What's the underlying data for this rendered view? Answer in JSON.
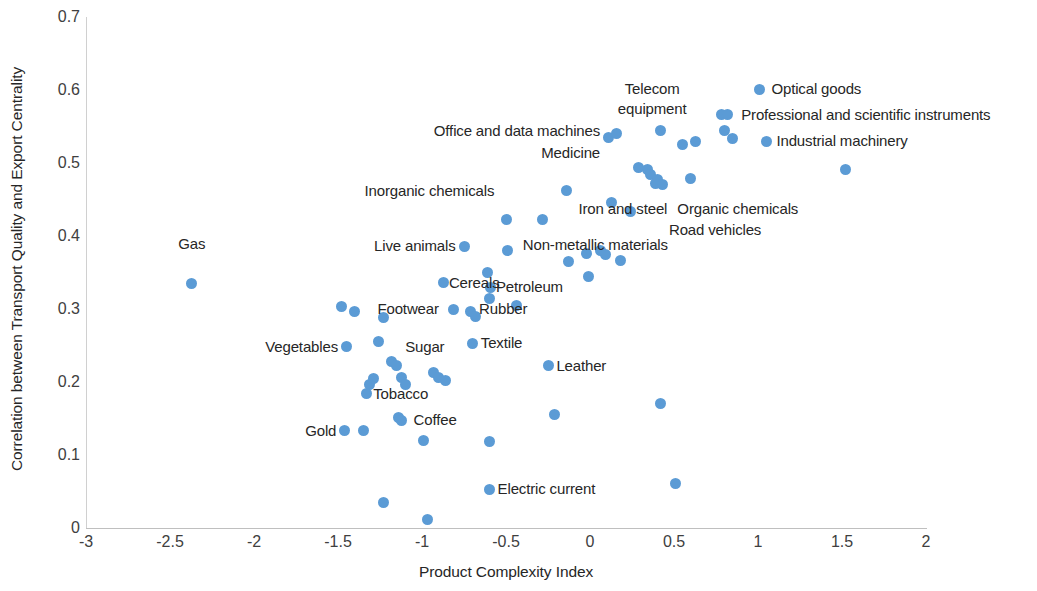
{
  "chart_data": {
    "type": "scatter",
    "title": "",
    "xlabel": "Product Complexity Index",
    "ylabel": "Correlation between Transport Quality and Export Centrality",
    "xlim": [
      -3,
      2
    ],
    "ylim": [
      0,
      0.7
    ],
    "xticks": [
      "-3",
      "-2.5",
      "-2",
      "-1.5",
      "-1",
      "-0.5",
      "0",
      "0.5",
      "1",
      "1.5",
      "2"
    ],
    "xtick_values": [
      -3,
      -2.5,
      -2,
      -1.5,
      -1,
      -0.5,
      0,
      0.5,
      1,
      1.5,
      2
    ],
    "yticks": [
      "0",
      "0.1",
      "0.2",
      "0.3",
      "0.4",
      "0.5",
      "0.6",
      "0.7"
    ],
    "ytick_values": [
      0,
      0.1,
      0.2,
      0.3,
      0.4,
      0.5,
      0.6,
      0.7
    ],
    "grid": false,
    "legend": false,
    "marker_color": "#5b9bd5",
    "axis_color": "#bfbfbf",
    "points": [
      {
        "x": -2.37,
        "y": 0.335
      },
      {
        "x": -1.48,
        "y": 0.304
      },
      {
        "x": -1.4,
        "y": 0.297
      },
      {
        "x": -1.45,
        "y": 0.248
      },
      {
        "x": -1.26,
        "y": 0.255
      },
      {
        "x": -1.29,
        "y": 0.205
      },
      {
        "x": -1.31,
        "y": 0.196
      },
      {
        "x": -1.33,
        "y": 0.184
      },
      {
        "x": -1.46,
        "y": 0.133
      },
      {
        "x": -1.35,
        "y": 0.133
      },
      {
        "x": -1.23,
        "y": 0.288
      },
      {
        "x": -1.18,
        "y": 0.228
      },
      {
        "x": -1.15,
        "y": 0.222
      },
      {
        "x": -1.12,
        "y": 0.206
      },
      {
        "x": -1.1,
        "y": 0.197
      },
      {
        "x": -1.14,
        "y": 0.152
      },
      {
        "x": -1.12,
        "y": 0.147
      },
      {
        "x": -1.23,
        "y": 0.035
      },
      {
        "x": -0.99,
        "y": 0.12
      },
      {
        "x": -0.97,
        "y": 0.011
      },
      {
        "x": -0.93,
        "y": 0.213
      },
      {
        "x": -0.9,
        "y": 0.206
      },
      {
        "x": -0.86,
        "y": 0.202
      },
      {
        "x": -0.87,
        "y": 0.336
      },
      {
        "x": -0.81,
        "y": 0.3
      },
      {
        "x": -0.75,
        "y": 0.386
      },
      {
        "x": -0.71,
        "y": 0.297
      },
      {
        "x": -0.68,
        "y": 0.29
      },
      {
        "x": -0.7,
        "y": 0.253
      },
      {
        "x": -0.61,
        "y": 0.35
      },
      {
        "x": -0.59,
        "y": 0.33
      },
      {
        "x": -0.6,
        "y": 0.315
      },
      {
        "x": -0.6,
        "y": 0.119
      },
      {
        "x": -0.6,
        "y": 0.053
      },
      {
        "x": -0.5,
        "y": 0.422
      },
      {
        "x": -0.49,
        "y": 0.38
      },
      {
        "x": -0.44,
        "y": 0.305
      },
      {
        "x": -0.28,
        "y": 0.422
      },
      {
        "x": -0.25,
        "y": 0.222
      },
      {
        "x": -0.21,
        "y": 0.155
      },
      {
        "x": -0.14,
        "y": 0.462
      },
      {
        "x": -0.13,
        "y": 0.365
      },
      {
        "x": -0.02,
        "y": 0.376
      },
      {
        "x": -0.01,
        "y": 0.344
      },
      {
        "x": 0.06,
        "y": 0.38
      },
      {
        "x": 0.09,
        "y": 0.374
      },
      {
        "x": 0.11,
        "y": 0.535
      },
      {
        "x": 0.16,
        "y": 0.541
      },
      {
        "x": 0.13,
        "y": 0.446
      },
      {
        "x": 0.18,
        "y": 0.366
      },
      {
        "x": 0.24,
        "y": 0.433
      },
      {
        "x": 0.29,
        "y": 0.494
      },
      {
        "x": 0.34,
        "y": 0.491
      },
      {
        "x": 0.36,
        "y": 0.484
      },
      {
        "x": 0.4,
        "y": 0.478
      },
      {
        "x": 0.39,
        "y": 0.472
      },
      {
        "x": 0.43,
        "y": 0.47
      },
      {
        "x": 0.42,
        "y": 0.544
      },
      {
        "x": 0.42,
        "y": 0.17
      },
      {
        "x": 0.51,
        "y": 0.061
      },
      {
        "x": 0.55,
        "y": 0.525
      },
      {
        "x": 0.6,
        "y": 0.479
      },
      {
        "x": 0.63,
        "y": 0.529
      },
      {
        "x": 0.78,
        "y": 0.566
      },
      {
        "x": 0.82,
        "y": 0.567
      },
      {
        "x": 0.8,
        "y": 0.545
      },
      {
        "x": 0.85,
        "y": 0.533
      },
      {
        "x": 1.01,
        "y": 0.601
      },
      {
        "x": 1.05,
        "y": 0.53
      },
      {
        "x": 1.52,
        "y": 0.491
      }
    ],
    "annotations": [
      {
        "text": "Gas",
        "x": -2.37,
        "y": 0.389,
        "align": "center"
      },
      {
        "text": "Vegetables",
        "x": -1.5,
        "y": 0.248,
        "align": "left"
      },
      {
        "text": "Gold",
        "x": -1.51,
        "y": 0.133,
        "align": "left"
      },
      {
        "text": "Tobacco",
        "x": -1.29,
        "y": 0.184,
        "align": "right"
      },
      {
        "text": "Sugar",
        "x": -1.1,
        "y": 0.248,
        "align": "right"
      },
      {
        "text": "Coffee",
        "x": -1.05,
        "y": 0.148,
        "align": "right"
      },
      {
        "text": "Footwear",
        "x": -0.9,
        "y": 0.3,
        "align": "left"
      },
      {
        "text": "Live animals",
        "x": -0.8,
        "y": 0.386,
        "align": "left"
      },
      {
        "text": "Cereals",
        "x": -0.84,
        "y": 0.336,
        "align": "right"
      },
      {
        "text": "Rubber",
        "x": -0.66,
        "y": 0.3,
        "align": "right"
      },
      {
        "text": "Textile",
        "x": -0.65,
        "y": 0.253,
        "align": "right"
      },
      {
        "text": "Petroleum",
        "x": -0.56,
        "y": 0.33,
        "align": "right"
      },
      {
        "text": "Inorganic chemicals",
        "x": -0.57,
        "y": 0.462,
        "align": "left"
      },
      {
        "text": "Leather",
        "x": -0.2,
        "y": 0.222,
        "align": "right"
      },
      {
        "text": "Electric current",
        "x": -0.55,
        "y": 0.053,
        "align": "right"
      },
      {
        "text": "Non-metallic materials",
        "x": -0.4,
        "y": 0.388,
        "align": "right"
      },
      {
        "text": "Office and data machines",
        "x": 0.06,
        "y": 0.544,
        "align": "left"
      },
      {
        "text": "Medicine",
        "x": 0.06,
        "y": 0.514,
        "align": "left"
      },
      {
        "text": "Telecom",
        "x": 0.37,
        "y": 0.601,
        "align": "center"
      },
      {
        "text": "equipment",
        "x": 0.37,
        "y": 0.574,
        "align": "center"
      },
      {
        "text": "Iron and steel",
        "x": 0.46,
        "y": 0.437,
        "align": "left"
      },
      {
        "text": "Road vehicles",
        "x": 0.47,
        "y": 0.408,
        "align": "right"
      },
      {
        "text": "Organic chemicals",
        "x": 0.52,
        "y": 0.437,
        "align": "right"
      },
      {
        "text": "Optical goods",
        "x": 1.08,
        "y": 0.601,
        "align": "right"
      },
      {
        "text": "Professional and scientific instruments",
        "x": 0.9,
        "y": 0.566,
        "align": "right"
      },
      {
        "text": "Industrial machinery",
        "x": 1.11,
        "y": 0.53,
        "align": "right"
      }
    ]
  },
  "axes": {
    "x_title": "Product Complexity Index",
    "y_title": "Correlation between Transport Quality and Export Centrality"
  }
}
